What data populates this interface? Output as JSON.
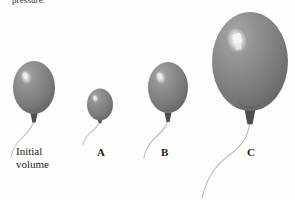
{
  "figure": {
    "background_color": "#fdfdfc",
    "top_caption_fragment": "pressure.",
    "initial_label_line1": "Initial",
    "initial_label_line2": "volume",
    "balloon_fill_dark": "#6e6e6e",
    "balloon_fill_mid": "#8a8a8a",
    "balloon_fill_light": "#a6a6a6",
    "highlight_color": "#f2f2f2",
    "knot_color": "#4a4a4a",
    "string_color": "#b9b9b9",
    "label_color": "#1a1a1a"
  },
  "balloons": [
    {
      "id": "initial",
      "label": "Initial volume",
      "cx": 34,
      "cy": 88,
      "rx": 21,
      "ry": 27,
      "relative_size": "reference"
    },
    {
      "id": "a",
      "label": "A",
      "cx": 100,
      "cy": 105,
      "rx": 13,
      "ry": 16,
      "relative_size": "smallest"
    },
    {
      "id": "b",
      "label": "B",
      "cx": 168,
      "cy": 88,
      "rx": 20,
      "ry": 26,
      "relative_size": "medium"
    },
    {
      "id": "c",
      "label": "C",
      "cx": 250,
      "cy": 62,
      "rx": 38,
      "ry": 50,
      "relative_size": "largest"
    }
  ],
  "labels": {
    "a": "A",
    "b": "B",
    "c": "C"
  },
  "icons": {
    "balloon": "balloon-icon",
    "string": "balloon-string-icon",
    "knot": "balloon-knot-icon",
    "highlight": "balloon-highlight-icon"
  }
}
